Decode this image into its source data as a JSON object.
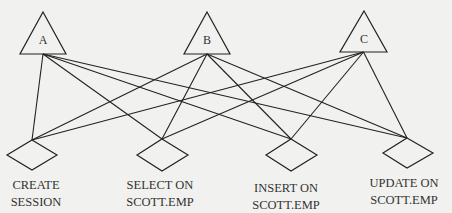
{
  "diagram": {
    "type": "bipartite-graph",
    "colors": {
      "background": "#f1f1ef",
      "stroke": "#222222",
      "text": "#333333"
    },
    "roles": [
      {
        "id": "A",
        "label": "A",
        "shape": "triangle",
        "apex": [
          43,
          12
        ],
        "base_left": [
          20,
          54
        ],
        "base_right": [
          66,
          54
        ],
        "label_pos": [
          43,
          44
        ]
      },
      {
        "id": "B",
        "label": "B",
        "shape": "triangle",
        "apex": [
          207,
          12
        ],
        "base_left": [
          184,
          54
        ],
        "base_right": [
          230,
          54
        ],
        "label_pos": [
          207,
          44
        ]
      },
      {
        "id": "C",
        "label": "C",
        "shape": "triangle",
        "apex": [
          364,
          11
        ],
        "base_left": [
          340,
          52
        ],
        "base_right": [
          387,
          52
        ],
        "label_pos": [
          364,
          43
        ]
      }
    ],
    "privileges": [
      {
        "id": "P1",
        "line1": "CREATE",
        "line2": "SESSION",
        "shape": "diamond",
        "top": [
          32,
          140
        ],
        "left": [
          7,
          155
        ],
        "right": [
          57,
          155
        ],
        "bottom": [
          32,
          170
        ],
        "text_x": 36,
        "text_y1": 189,
        "text_y2": 206
      },
      {
        "id": "P2",
        "line1": "SELECT ON",
        "line2": "SCOTT.EMP",
        "shape": "diamond",
        "top": [
          162,
          139
        ],
        "left": [
          137,
          155
        ],
        "right": [
          188,
          155
        ],
        "bottom": [
          162,
          171
        ],
        "text_x": 160,
        "text_y1": 189,
        "text_y2": 206
      },
      {
        "id": "P3",
        "line1": "INSERT ON",
        "line2": "SCOTT.EMP",
        "shape": "diamond",
        "top": [
          291,
          139
        ],
        "left": [
          266,
          155
        ],
        "right": [
          317,
          155
        ],
        "bottom": [
          291,
          171
        ],
        "text_x": 286,
        "text_y1": 192,
        "text_y2": 209
      },
      {
        "id": "P4",
        "line1": "UPDATE ON",
        "line2": "SCOTT.EMP",
        "shape": "diamond",
        "top": [
          407,
          138
        ],
        "left": [
          383,
          153
        ],
        "right": [
          433,
          153
        ],
        "bottom": [
          407,
          168
        ],
        "text_x": 404,
        "text_y1": 187,
        "text_y2": 204
      }
    ],
    "edges": [
      {
        "from": "A",
        "to": "P1"
      },
      {
        "from": "A",
        "to": "P2"
      },
      {
        "from": "A",
        "to": "P3"
      },
      {
        "from": "A",
        "to": "P4"
      },
      {
        "from": "B",
        "to": "P1"
      },
      {
        "from": "B",
        "to": "P2"
      },
      {
        "from": "B",
        "to": "P3"
      },
      {
        "from": "B",
        "to": "P4"
      },
      {
        "from": "C",
        "to": "P1"
      },
      {
        "from": "C",
        "to": "P2"
      },
      {
        "from": "C",
        "to": "P3"
      },
      {
        "from": "C",
        "to": "P4"
      }
    ]
  }
}
